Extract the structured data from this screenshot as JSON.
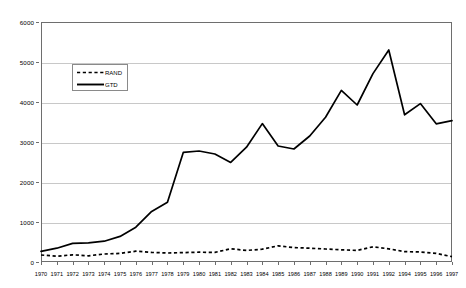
{
  "chart_data": {
    "type": "line",
    "title": "",
    "subtitle": "",
    "xlabel": "",
    "ylabel": "",
    "xlim_note": "categorical year axis",
    "ylim": [
      0,
      6000
    ],
    "y_ticks": [
      0,
      1000,
      2000,
      3000,
      4000,
      5000,
      6000
    ],
    "grid": true,
    "legend_position": "upper-left-inside",
    "categories": [
      "1970",
      "1971",
      "1972",
      "1973",
      "1974",
      "1975",
      "1976",
      "1977",
      "1978",
      "1979",
      "1980",
      "1981",
      "1982",
      "1983",
      "1984",
      "1985",
      "1986",
      "1987",
      "1988",
      "1989",
      "1990",
      "1991",
      "1992",
      "1994",
      "1995",
      "1996",
      "1997"
    ],
    "series": [
      {
        "name": "RAND",
        "style": "dashed",
        "color": "#000000",
        "values": [
          175,
          145,
          180,
          155,
          200,
          215,
          270,
          240,
          225,
          235,
          245,
          240,
          330,
          290,
          320,
          405,
          360,
          345,
          325,
          305,
          290,
          380,
          330,
          260,
          250,
          215,
          135
        ]
      },
      {
        "name": "GTD",
        "style": "solid",
        "color": "#000000",
        "values": [
          265,
          345,
          465,
          480,
          520,
          640,
          870,
          1265,
          1495,
          2740,
          2775,
          2700,
          2490,
          2870,
          3460,
          2900,
          2825,
          3150,
          3620,
          4290,
          3925,
          4710,
          5300,
          3680,
          3960,
          3455,
          3535
        ]
      }
    ]
  },
  "legend": {
    "entries": [
      {
        "label": "RAND"
      },
      {
        "label": "GTD"
      }
    ]
  },
  "axis": {
    "y_tick_labels": [
      "6000",
      "5000",
      "4000",
      "3000",
      "2000",
      "1000",
      "0"
    ],
    "x_tick_labels": [
      "1970",
      "1971",
      "1972",
      "1973",
      "1974",
      "1975",
      "1976",
      "1977",
      "1978",
      "1979",
      "1980",
      "1981",
      "1982",
      "1983",
      "1984",
      "1985",
      "1986",
      "1987",
      "1988",
      "1989",
      "1990",
      "1991",
      "1992",
      "1994",
      "1995",
      "1996",
      "1997"
    ]
  },
  "colors": {
    "series_line": "#000000",
    "gridline": "#c8c8c8",
    "frame": "#6e6e6e",
    "background": "#ffffff"
  }
}
